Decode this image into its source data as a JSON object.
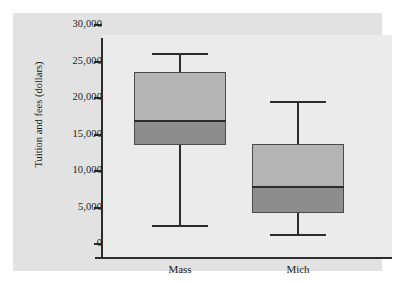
{
  "chart_data": {
    "type": "box",
    "title": "",
    "xlabel": "",
    "ylabel": "Tuition and fees (dollars)",
    "categories": [
      "Mass",
      "Mich"
    ],
    "ylim": [
      0,
      30000
    ],
    "ytick_labels": [
      "30,000",
      "25,000",
      "20,000",
      "15,000",
      "10,000",
      "5,000",
      "0"
    ],
    "ytick_values": [
      30000,
      25000,
      20000,
      15000,
      10000,
      5000,
      0
    ],
    "grid": false,
    "legend": "none",
    "boxes": [
      {
        "name": "Mass",
        "min": 2500,
        "q1": 13500,
        "median": 16800,
        "q3": 23500,
        "max": 26000
      },
      {
        "name": "Mich",
        "min": 1200,
        "q1": 4200,
        "median": 7800,
        "q3": 13700,
        "max": 19500
      }
    ],
    "colors": {
      "box_upper_fill": "#b4b4b4",
      "box_lower_fill": "#8d8d8d",
      "box_edge": "#4a4a4a",
      "whisker": "#2c2c2c",
      "axis": "#2c2c2c",
      "panel_background": "#e2e2e2",
      "plot_background": "#ebebeb"
    }
  }
}
